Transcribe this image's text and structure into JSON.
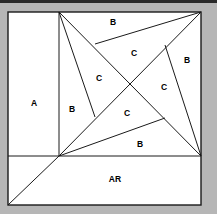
{
  "figure": {
    "background_color": "#b6b6b6",
    "region_fill_color": "#ffffff",
    "line_color": "#1a1a1a",
    "label_color": "#000000",
    "outer_square": {
      "x": 8,
      "y": 12,
      "width": 193,
      "height": 193
    },
    "vertices": {
      "top_left": [
        8,
        12
      ],
      "top_mid": [
        59,
        12
      ],
      "top_right": [
        201,
        12
      ],
      "left_mid": [
        8,
        156
      ],
      "center_pivot": [
        59,
        156
      ],
      "right_mid": [
        201,
        156
      ],
      "bottom_left": [
        8,
        205
      ],
      "bottom_right": [
        201,
        205
      ],
      "inner_top": [
        95,
        44
      ],
      "inner_right": [
        165,
        45
      ],
      "inner_left": [
        95,
        117
      ],
      "inner_bottom": [
        165,
        118
      ],
      "crossing": [
        130,
        84
      ]
    },
    "labels": [
      {
        "text": "A",
        "x": 34,
        "y": 104,
        "region": "left-rectangle"
      },
      {
        "text": "AR",
        "x": 115,
        "y": 180,
        "region": "bottom-rectangle"
      },
      {
        "text": "B",
        "x": 113,
        "y": 23,
        "region": "top-triangle"
      },
      {
        "text": "B",
        "x": 187,
        "y": 61,
        "region": "right-triangle"
      },
      {
        "text": "B",
        "x": 72,
        "y": 110,
        "region": "left-triangle"
      },
      {
        "text": "B",
        "x": 140,
        "y": 145,
        "region": "bottom-triangle"
      },
      {
        "text": "C",
        "x": 134,
        "y": 54,
        "region": "center-top"
      },
      {
        "text": "C",
        "x": 99,
        "y": 79,
        "region": "center-left"
      },
      {
        "text": "C",
        "x": 164,
        "y": 88,
        "region": "center-right"
      },
      {
        "text": "C",
        "x": 127,
        "y": 114,
        "region": "center-bottom"
      }
    ]
  }
}
